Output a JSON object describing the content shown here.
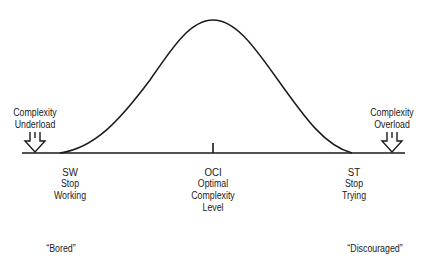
{
  "diagram": {
    "type": "bell-curve",
    "left_marker": {
      "label_line1": "Complexity",
      "label_line2": "Underload",
      "icon": "double-down-arrow-icon"
    },
    "right_marker": {
      "label_line1": "Complexity",
      "label_line2": "Overload",
      "icon": "double-down-arrow-icon"
    },
    "points": [
      {
        "abbr": "SW",
        "line1": "Stop",
        "line2": "Working"
      },
      {
        "abbr": "OCI",
        "line1": "Optimal",
        "line2": "Complexity",
        "line3": "Level"
      },
      {
        "abbr": "ST",
        "line1": "Stop",
        "line2": "Trying"
      }
    ],
    "states": {
      "left": "“Bored”",
      "right": "“Discouraged”"
    },
    "colors": {
      "line": "#1a1a1a",
      "background": "#ffffff"
    }
  }
}
